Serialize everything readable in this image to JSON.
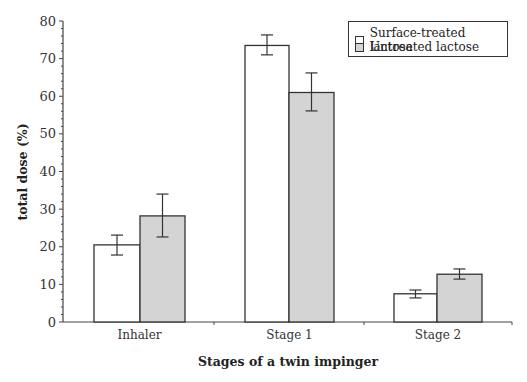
{
  "chart_data": {
    "type": "bar",
    "title": "",
    "xlabel": "Stages of a twin impinger",
    "ylabel": "total dose (%)",
    "ylim": [
      0,
      80
    ],
    "yticks": [
      0,
      10,
      20,
      30,
      40,
      50,
      60,
      70,
      80
    ],
    "grid": false,
    "legend_position": "upper right",
    "categories": [
      "Inhaler",
      "Stage 1",
      "Stage 2"
    ],
    "series": [
      {
        "name": "Surface-treated lactose",
        "color": "#ffffff",
        "values": [
          20.5,
          73.5,
          7.5
        ],
        "error_low": [
          17.8,
          71.0,
          6.4
        ],
        "error_high": [
          23.1,
          76.3,
          8.5
        ]
      },
      {
        "name": "Untreated lactose",
        "color": "#d4d4d4",
        "values": [
          28.2,
          61.0,
          12.7
        ],
        "error_low": [
          22.6,
          56.1,
          11.4
        ],
        "error_high": [
          34.0,
          66.2,
          14.1
        ]
      }
    ]
  },
  "legend": {
    "items": [
      "Surface-treated lactose",
      "Untreated lactose"
    ]
  },
  "axis": {
    "x_title": "Stages of a twin impinger",
    "y_title": "total dose (%)"
  }
}
